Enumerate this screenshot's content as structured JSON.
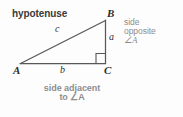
{
  "figure": {
    "type": "right-triangle-trigonometry-diagram",
    "background_color": "#fdfdfd",
    "line_color": "#58585a",
    "label_color": "#2e2e2e",
    "annotation_color": "#8d8d8d"
  },
  "labels": {
    "hypotenuse": "hypotenuse",
    "side_opposite": {
      "line1": "side",
      "line2": "opposite",
      "line3": "∠A"
    },
    "side_adjacent": {
      "line1": "side adjacent",
      "line2": "to ∠A"
    }
  },
  "vertices": {
    "a": "A",
    "b": "B",
    "c": "C"
  },
  "sides": {
    "hypotenuse_letter": "c",
    "opposite_letter": "a",
    "adjacent_letter": "b"
  },
  "markers": {
    "right_angle": "right-angle-square"
  }
}
